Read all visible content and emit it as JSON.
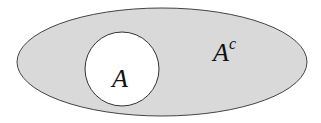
{
  "diagram": {
    "type": "venn",
    "title": "",
    "universe": {
      "shape": "ellipse",
      "fill": "#d9d9d9",
      "stroke": "#444444",
      "label": "A",
      "label_superscript": "c"
    },
    "set": {
      "shape": "circle",
      "fill": "#ffffff",
      "stroke": "#333333",
      "label": "A"
    }
  }
}
